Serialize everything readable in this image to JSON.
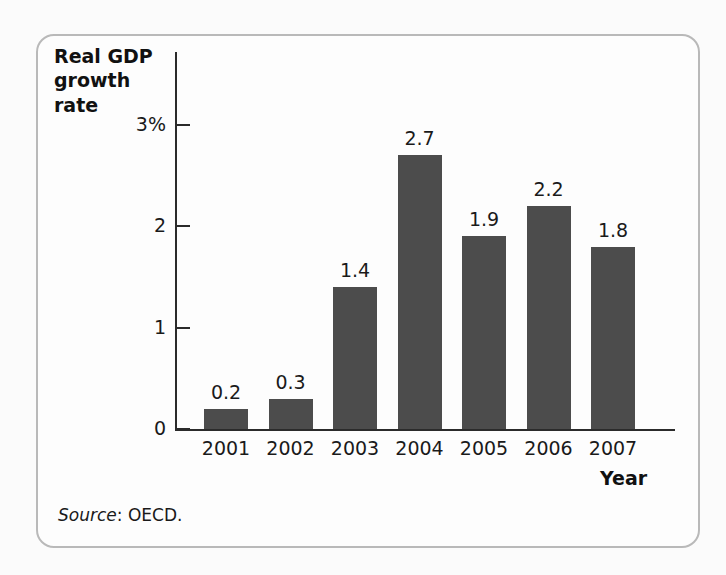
{
  "figure": {
    "source_label": "Source",
    "source_separator": ": ",
    "source_value": "OECD.",
    "frame_color": "#b9b9b9",
    "bar_color": "#4c4c4c",
    "axis_color": "#2b2b2b",
    "background_color": "#fbfbfb"
  },
  "chart_data": {
    "type": "bar",
    "title": "",
    "subtitle": "",
    "xlabel": "Year",
    "ylabel": "Real GDP growth rate",
    "ylabel_line1": "Real GDP",
    "ylabel_line2": "growth rate",
    "categories": [
      "2001",
      "2002",
      "2003",
      "2004",
      "2005",
      "2006",
      "2007"
    ],
    "values": [
      0.2,
      0.3,
      1.4,
      2.7,
      1.9,
      2.2,
      1.8
    ],
    "value_labels": [
      "0.2",
      "0.3",
      "1.4",
      "2.7",
      "1.9",
      "2.2",
      "1.8"
    ],
    "yticks": [
      0,
      1,
      2,
      3
    ],
    "ytick_labels": [
      "0",
      "1",
      "2",
      "3%"
    ],
    "ylim": [
      0,
      3
    ],
    "grid": false,
    "legend": false,
    "legend_position": "none",
    "units": "percent"
  }
}
